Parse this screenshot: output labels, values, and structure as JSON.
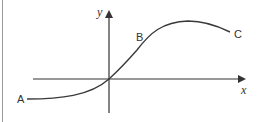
{
  "diagram": {
    "axes": {
      "x_label": "x",
      "y_label": "y"
    },
    "points": {
      "A": "A",
      "B": "B",
      "C": "C"
    },
    "colors": {
      "axis": "#333333",
      "curve": "#3a3a3a",
      "label": "#333333",
      "frame_edge": "#9a9a9a"
    }
  }
}
